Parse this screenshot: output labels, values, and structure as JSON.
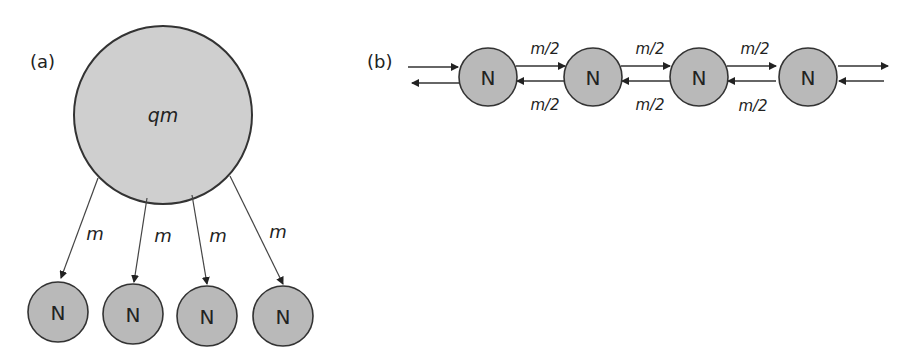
{
  "panel_a": {
    "label": "(a)",
    "hub": {
      "label": "qm",
      "fill": "#cfcfcf"
    },
    "edge_labels": [
      "m",
      "m",
      "m",
      "m"
    ],
    "nodes": [
      "N",
      "N",
      "N",
      "N"
    ]
  },
  "panel_b": {
    "label": "(b)",
    "nodes": [
      "N",
      "N",
      "N",
      "N"
    ],
    "top_labels": [
      "m/2",
      "m/2",
      "m/2"
    ],
    "bottom_labels": [
      "m/2",
      "m/2",
      "m/2"
    ]
  },
  "colors": {
    "node_fill": "#b9b9b9",
    "hub_fill": "#cfcfcf",
    "stroke": "#333333"
  }
}
